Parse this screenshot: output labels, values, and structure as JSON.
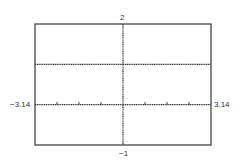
{
  "chart_data": {
    "type": "line",
    "title": "",
    "xlabel": "",
    "ylabel": "",
    "xlim": [
      -3.14,
      3.14
    ],
    "ylim": [
      -1,
      2
    ],
    "grid": false,
    "legend": null,
    "tick_labels": {
      "xmin": "-3.14",
      "xmax": "3.14",
      "ymin": "-1",
      "ymax": "2"
    },
    "x_ticks": [
      -2.356,
      -1.571,
      -0.785,
      0.785,
      1.571,
      2.356
    ],
    "series": [
      {
        "name": "y = 1",
        "x": [
          -3.14,
          3.14
        ],
        "y": [
          1,
          1
        ],
        "style": "dotted"
      }
    ],
    "colors": {
      "frame": "#444444",
      "axis": "#333333",
      "line": "#333333"
    }
  }
}
